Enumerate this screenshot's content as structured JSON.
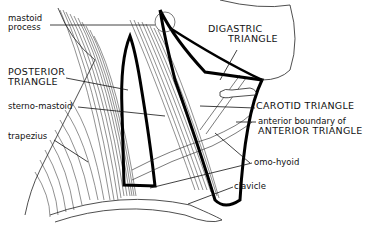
{
  "figure": {
    "labels": {
      "mastoid_1": "mastoid",
      "mastoid_2": "process",
      "posterior_1": "POSTERIOR",
      "posterior_2": "TRIANGLE",
      "sterno_mastoid": "sterno-mastoid",
      "trapezius": "trapezius",
      "digastric_1": "DIGASTRIC",
      "digastric_2": "TRIANGLE",
      "carotid": "CAROTID TRIANGLE",
      "anterior_1": "anterior boundary of",
      "anterior_2": "ANTERIOR TRIANGLE",
      "omo_hyoid": "omo-hyoid",
      "clavicle": "clavicle"
    },
    "colors": {
      "ink": "#111111",
      "background": "#ffffff"
    }
  }
}
